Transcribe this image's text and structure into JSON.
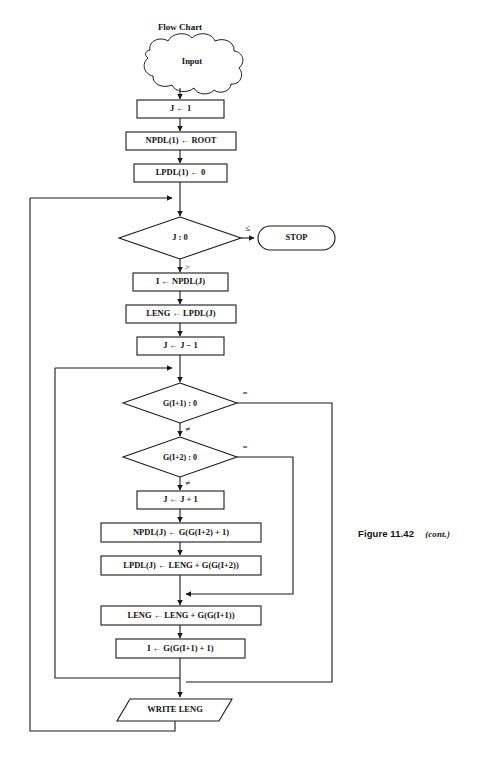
{
  "figure": {
    "caption_label": "Figure 11.42",
    "caption_note": "(cont.)"
  },
  "diagram": {
    "title": "Flow Chart",
    "type": "flowchart",
    "nodes": [
      {
        "id": "input",
        "shape": "cloud",
        "label": "Input"
      },
      {
        "id": "p1",
        "shape": "process",
        "label": "J ← 1"
      },
      {
        "id": "p2",
        "shape": "process",
        "label": "NPDL(1) ← ROOT"
      },
      {
        "id": "p3",
        "shape": "process",
        "label": "LPDL(1) ← 0"
      },
      {
        "id": "d1",
        "shape": "decision",
        "label": "J : 0"
      },
      {
        "id": "stop",
        "shape": "terminal",
        "label": "STOP"
      },
      {
        "id": "p4",
        "shape": "process",
        "label": "I ← NPDL(J)"
      },
      {
        "id": "p5",
        "shape": "process",
        "label": "LENG ← LPDL(J)"
      },
      {
        "id": "p6",
        "shape": "process",
        "label": "J ← J − 1"
      },
      {
        "id": "d2",
        "shape": "decision",
        "label": "G(I+1) : 0"
      },
      {
        "id": "d3",
        "shape": "decision",
        "label": "G(I+2) : 0"
      },
      {
        "id": "p7",
        "shape": "process",
        "label": "J ← J + 1"
      },
      {
        "id": "p8",
        "shape": "process",
        "label": "NPDL(J) ← G(G(I+2) + 1)"
      },
      {
        "id": "p9",
        "shape": "process",
        "label": "LPDL(J) ← LENG + G(G(I+2))"
      },
      {
        "id": "p10",
        "shape": "process",
        "label": "LENG ← LENG + G(G(I+1))"
      },
      {
        "id": "p11",
        "shape": "process",
        "label": "I ← G(G(I+1) + 1)"
      },
      {
        "id": "write",
        "shape": "parallelogram",
        "label": "WRITE LENG"
      }
    ],
    "branch_labels": {
      "d1_true": "≤",
      "d1_false": ">",
      "d2_equal": "=",
      "d2_notequal": "≠",
      "d3_equal": "=",
      "d3_notequal": "≠"
    },
    "colors": {
      "stroke": "#1a1a1a",
      "fill": "#ffffff",
      "text": "#111111"
    }
  }
}
